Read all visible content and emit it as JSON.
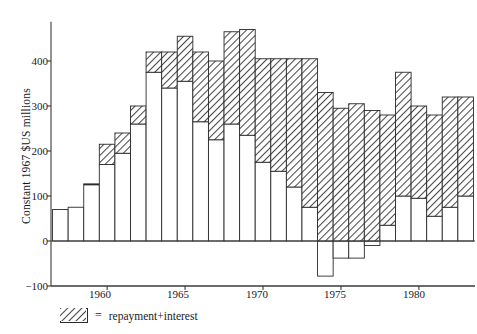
{
  "chart_data": {
    "type": "bar",
    "title": "",
    "subtitle": "",
    "xlabel": "",
    "ylabel": "Constant 1967 $US millions",
    "stacked": true,
    "grid": false,
    "legend_position": "below-left",
    "xlim": [
      1956.4,
      1983.6
    ],
    "ylim": [
      -100,
      487
    ],
    "yticks": [
      -100,
      0,
      100,
      200,
      300,
      400
    ],
    "ytick_labels": [
      "−100",
      "0",
      "100",
      "200",
      "300",
      "400"
    ],
    "xticks": [
      1960,
      1965,
      1970,
      1975,
      1980
    ],
    "xtick_labels": [
      "1960",
      "1965",
      "1970",
      "1975",
      "1980"
    ],
    "categories": [
      1957,
      1958,
      1959,
      1960,
      1961,
      1962,
      1963,
      1964,
      1965,
      1966,
      1967,
      1968,
      1969,
      1970,
      1971,
      1972,
      1973,
      1974,
      1975,
      1976,
      1977,
      1978,
      1979,
      1980,
      1981,
      1982,
      1983
    ],
    "series": [
      {
        "name": "net",
        "fill": "white",
        "values": [
          70,
          75,
          125,
          170,
          195,
          260,
          375,
          340,
          355,
          265,
          225,
          260,
          235,
          175,
          155,
          120,
          75,
          -78,
          -38,
          -38,
          -10,
          35,
          100,
          95,
          55,
          75,
          100
        ]
      },
      {
        "name": "repayment+interest",
        "fill": "hatched",
        "values": [
          0,
          0,
          2,
          45,
          45,
          40,
          45,
          80,
          100,
          155,
          175,
          205,
          235,
          230,
          250,
          285,
          330,
          330,
          295,
          305,
          290,
          245,
          275,
          205,
          225,
          245,
          220
        ]
      }
    ],
    "totals": [
      70,
      75,
      127,
      215,
      240,
      300,
      420,
      420,
      455,
      420,
      400,
      465,
      470,
      405,
      405,
      405,
      405,
      252,
      257,
      267,
      280,
      280,
      375,
      300,
      280,
      320,
      320
    ]
  },
  "legend": {
    "equals": "=",
    "label": "repayment+interest",
    "swatch_icon": "hatch-swatch-icon"
  },
  "colors": {
    "axis": "#3a3a3a",
    "bar_outline": "#2b2b2b",
    "hatch": "#555555",
    "net_fill": "#ffffff",
    "background": "#ffffff"
  }
}
